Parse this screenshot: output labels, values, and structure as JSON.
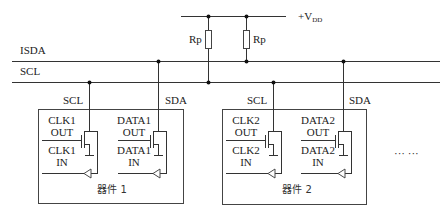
{
  "diagram": {
    "type": "circuit-schematic",
    "supply": {
      "label": "+V",
      "subscript": "DD"
    },
    "buses": [
      {
        "id": "isda",
        "label": "ISDA",
        "y": 61
      },
      {
        "id": "scl",
        "label": "SCL",
        "y": 82
      }
    ],
    "resistors": [
      {
        "id": "rp1",
        "label": "Rp",
        "connects_to": "SCL"
      },
      {
        "id": "rp2",
        "label": "Rp",
        "connects_to": "ISDA"
      }
    ],
    "devices": [
      {
        "id": "device1",
        "name": "器件 1",
        "scl_tap_label": "SCL",
        "sda_tap_label": "SDA",
        "clk_out": [
          "CLK1",
          "OUT"
        ],
        "clk_in": [
          "CLK1",
          "IN"
        ],
        "data_out": [
          "DATA1",
          "OUT"
        ],
        "data_in": [
          "DATA1",
          "IN"
        ]
      },
      {
        "id": "device2",
        "name": "器件 2",
        "scl_tap_label": "SCL",
        "sda_tap_label": "SDA",
        "clk_out": [
          "CLK2",
          "OUT"
        ],
        "clk_in": [
          "CLK2",
          "IN"
        ],
        "data_out": [
          "DATA2",
          "OUT"
        ],
        "data_in": [
          "DATA2",
          "IN"
        ]
      }
    ],
    "continuation": "···   ···"
  }
}
